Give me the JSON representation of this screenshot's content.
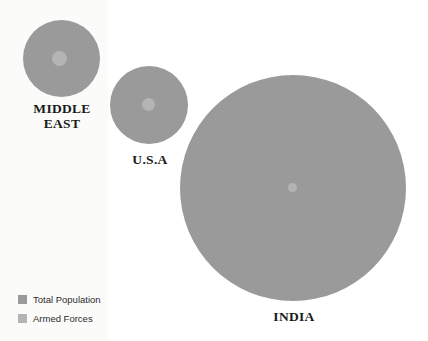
{
  "chart_data": {
    "type": "bubble",
    "title": "",
    "subtitle": "",
    "xlabel": "",
    "ylabel": "",
    "grid": false,
    "legend_position": "bottom-left",
    "series": [
      {
        "name": "Total Population",
        "color": "#9a9a9a"
      },
      {
        "name": "Armed Forces",
        "color": "#b4b4b4"
      }
    ],
    "categories": [
      "MIDDLE\nEAST",
      "U.S.A",
      "INDIA"
    ],
    "bubbles": [
      {
        "label": "MIDDLE\nEAST",
        "outer_diameter_px": 77,
        "inner_diameter_px": 15,
        "center_x_px": 61,
        "center_y_px": 58
      },
      {
        "label": "U.S.A",
        "outer_diameter_px": 78,
        "inner_diameter_px": 13,
        "center_x_px": 149,
        "center_y_px": 105
      },
      {
        "label": "INDIA",
        "outer_diameter_px": 226,
        "inner_diameter_px": 9,
        "center_x_px": 293,
        "center_y_px": 188
      }
    ]
  },
  "colors": {
    "total_population": "#9a9a9a",
    "armed_forces": "#b4b4b4",
    "background": "#ffffff",
    "panel": "#fbfbfa",
    "label_text": "#1a1a1a",
    "legend_text": "#2b2b2b"
  },
  "legend": {
    "items": [
      {
        "label": "Total Population",
        "color": "#9a9a9a"
      },
      {
        "label": "Armed Forces",
        "color": "#b4b4b4"
      }
    ]
  },
  "labels": {
    "middle_east": "MIDDLE\nEAST",
    "usa": "U.S.A",
    "india": "INDIA"
  }
}
